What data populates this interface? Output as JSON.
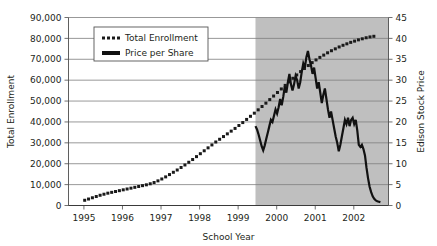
{
  "chart_data": {
    "type": "line",
    "title": "",
    "xlabel": "School Year",
    "ylabel": "Total Enrollment",
    "y2label": "Edison Stock Price",
    "grid": true,
    "legend_position": "top-center",
    "xlim": [
      1994.6,
      2002.9
    ],
    "ylim": [
      0,
      90000
    ],
    "y2lim": [
      0,
      45
    ],
    "xticks": [
      "1995",
      "1996",
      "1997",
      "1998",
      "1999",
      "2000",
      "2001",
      "2002"
    ],
    "xtick_values": [
      1995,
      1996,
      1997,
      1998,
      1999,
      2000,
      2001,
      2002
    ],
    "yticks": [
      "0",
      "10,000",
      "20,000",
      "30,000",
      "40,000",
      "50,000",
      "60,000",
      "70,000",
      "80,000",
      "90,000"
    ],
    "ytick_values": [
      0,
      10000,
      20000,
      30000,
      40000,
      50000,
      60000,
      70000,
      80000,
      90000
    ],
    "y2ticks": [
      "0",
      "5",
      "10",
      "15",
      "20",
      "25",
      "30",
      "35",
      "40",
      "45"
    ],
    "y2tick_values": [
      0,
      5,
      10,
      15,
      20,
      25,
      30,
      35,
      40,
      45
    ],
    "shaded_region": {
      "label": "",
      "x_start": 1999.45,
      "x_end": 2002.9,
      "color": "#bfbfbf"
    },
    "series": [
      {
        "name": "Total Enrollment",
        "axis": "left",
        "style": "dotted",
        "color": "#1a1a1a",
        "x": [
          1995.02,
          1995.12,
          1995.22,
          1995.32,
          1995.42,
          1995.52,
          1995.62,
          1995.72,
          1995.82,
          1995.92,
          1996.02,
          1996.12,
          1996.22,
          1996.32,
          1996.42,
          1996.52,
          1996.62,
          1996.72,
          1996.82,
          1996.92,
          1997.02,
          1997.12,
          1997.22,
          1997.32,
          1997.42,
          1997.52,
          1997.62,
          1997.72,
          1997.82,
          1997.92,
          1998.02,
          1998.12,
          1998.22,
          1998.32,
          1998.42,
          1998.52,
          1998.62,
          1998.72,
          1998.82,
          1998.92,
          1999.02,
          1999.12,
          1999.22,
          1999.32,
          1999.42,
          1999.52,
          1999.62,
          1999.72,
          1999.82,
          1999.92,
          2000.02,
          2000.12,
          2000.22,
          2000.32,
          2000.42,
          2000.52,
          2000.62,
          2000.72,
          2000.82,
          2000.92,
          2001.02,
          2001.12,
          2001.22,
          2001.32,
          2001.42,
          2001.52,
          2001.62,
          2001.72,
          2001.82,
          2001.92,
          2002.02,
          2002.12,
          2002.22,
          2002.32,
          2002.42,
          2002.52
        ],
        "values": [
          2500,
          3100,
          3700,
          4300,
          4900,
          5400,
          5900,
          6300,
          6700,
          7100,
          7500,
          7900,
          8300,
          8700,
          9100,
          9500,
          9900,
          10400,
          11000,
          11800,
          12700,
          13700,
          14800,
          15900,
          17000,
          18200,
          19400,
          20700,
          22000,
          23400,
          24800,
          26200,
          27600,
          29000,
          30400,
          31700,
          33000,
          34300,
          35600,
          36900,
          38300,
          39700,
          41200,
          42700,
          44200,
          45800,
          47400,
          49000,
          50700,
          52400,
          54100,
          55800,
          57500,
          59200,
          60900,
          62500,
          64100,
          65600,
          67000,
          68400,
          69700,
          70900,
          72000,
          73100,
          74100,
          75000,
          75900,
          76700,
          77400,
          78100,
          78700,
          79300,
          79800,
          80300,
          80700,
          81000
        ]
      },
      {
        "name": "Price per Share",
        "axis": "right",
        "style": "solid",
        "color": "#111111",
        "x": [
          1999.45,
          1999.49,
          1999.53,
          1999.57,
          1999.61,
          1999.65,
          1999.69,
          1999.73,
          1999.77,
          1999.81,
          1999.85,
          1999.89,
          1999.93,
          1999.97,
          2000.01,
          2000.05,
          2000.09,
          2000.13,
          2000.17,
          2000.21,
          2000.25,
          2000.29,
          2000.33,
          2000.37,
          2000.41,
          2000.45,
          2000.49,
          2000.53,
          2000.57,
          2000.61,
          2000.65,
          2000.69,
          2000.73,
          2000.77,
          2000.81,
          2000.85,
          2000.89,
          2000.93,
          2000.97,
          2001.01,
          2001.05,
          2001.09,
          2001.13,
          2001.17,
          2001.21,
          2001.25,
          2001.29,
          2001.33,
          2001.37,
          2001.41,
          2001.45,
          2001.49,
          2001.53,
          2001.57,
          2001.61,
          2001.65,
          2001.69,
          2001.73,
          2001.77,
          2001.81,
          2001.85,
          2001.89,
          2001.93,
          2001.97,
          2002.01,
          2002.05,
          2002.09,
          2002.13,
          2002.17,
          2002.21,
          2002.25,
          2002.29,
          2002.33,
          2002.37,
          2002.41,
          2002.45,
          2002.49,
          2002.53,
          2002.57,
          2002.61,
          2002.65,
          2002.69
        ],
        "values": [
          19.0,
          18.2,
          17.0,
          15.6,
          14.2,
          13.2,
          14.4,
          16.0,
          17.5,
          19.0,
          20.5,
          20.0,
          21.5,
          23.0,
          22.0,
          23.5,
          25.5,
          24.0,
          26.0,
          28.5,
          27.0,
          29.5,
          31.5,
          29.0,
          27.5,
          29.0,
          31.0,
          30.0,
          28.0,
          29.5,
          32.0,
          34.0,
          33.0,
          35.5,
          37.0,
          35.0,
          33.5,
          31.5,
          33.0,
          30.5,
          28.0,
          29.5,
          27.0,
          24.5,
          26.5,
          28.0,
          25.5,
          23.0,
          21.0,
          22.5,
          20.5,
          18.5,
          16.5,
          15.0,
          13.0,
          14.5,
          16.5,
          18.5,
          20.5,
          19.5,
          21.0,
          19.0,
          20.5,
          21.0,
          19.5,
          20.5,
          18.0,
          14.5,
          14.0,
          14.5,
          13.5,
          12.0,
          9.0,
          6.5,
          4.5,
          3.2,
          2.2,
          1.6,
          1.2,
          1.0,
          0.9,
          0.8
        ]
      }
    ]
  },
  "legend": {
    "entries": [
      {
        "label": "Total Enrollment",
        "style": "dotted"
      },
      {
        "label": "Price per Share",
        "style": "solid"
      }
    ]
  },
  "colors": {
    "shaded": "#bfbfbf",
    "grid": "#7d7d7d",
    "series_dotted": "#1a1a1a",
    "series_solid": "#111111",
    "text": "#231f20",
    "background": "#ffffff"
  }
}
